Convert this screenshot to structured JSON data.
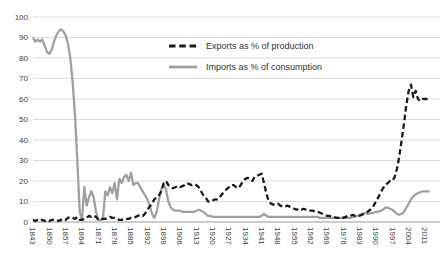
{
  "chart_data": {
    "type": "line",
    "title": "",
    "xlabel": "",
    "ylabel": "",
    "ylim": [
      0,
      100
    ],
    "y_ticks": [
      0,
      10,
      20,
      30,
      40,
      50,
      60,
      70,
      80,
      90,
      100
    ],
    "x_ticks": [
      1843,
      1850,
      1857,
      1864,
      1871,
      1878,
      1885,
      1892,
      1899,
      1906,
      1913,
      1920,
      1927,
      1934,
      1941,
      1948,
      1955,
      1962,
      1969,
      1976,
      1983,
      1990,
      1997,
      2004,
      2011
    ],
    "x_start": 1843,
    "x_end": 2013,
    "grid": "horizontal",
    "legend_position": "inside-top-center",
    "series": [
      {
        "name": "Exports as % of production",
        "style": "dashed",
        "color": "#1a1a1a",
        "values": [
          1,
          0.5,
          1,
          0.5,
          1,
          0.5,
          1,
          0.5,
          1,
          1,
          1,
          0.5,
          1,
          1.5,
          1,
          2,
          2.5,
          2,
          1.5,
          2.5,
          1,
          1,
          1.5,
          2,
          3,
          2.5,
          3,
          2.5,
          1,
          1,
          1.5,
          1.5,
          2,
          2.5,
          2,
          2,
          1.5,
          1,
          1,
          1.5,
          1.5,
          1.5,
          2,
          2,
          2.5,
          3,
          3.5,
          3,
          4,
          6,
          7.5,
          9,
          11,
          12,
          13,
          15,
          19,
          20,
          18,
          17,
          16.5,
          17,
          17.5,
          17,
          17.5,
          18,
          19,
          18.5,
          18,
          18.5,
          18,
          17,
          15,
          13,
          12,
          10,
          10,
          10.5,
          11,
          11,
          12,
          13.5,
          15,
          16,
          17,
          18,
          18,
          17,
          16.5,
          18,
          20,
          21,
          21.5,
          21,
          20,
          22,
          22.5,
          23,
          23.5,
          19,
          14,
          10,
          9,
          8.5,
          8.5,
          9,
          8,
          7.5,
          7.5,
          8,
          7.5,
          7,
          6.5,
          6,
          6.5,
          6,
          6.5,
          6,
          5.5,
          5.5,
          5.5,
          5,
          5,
          4.5,
          4,
          3.5,
          3,
          3,
          2.5,
          2.5,
          2,
          2,
          2.5,
          2,
          2.5,
          3,
          3,
          3.5,
          3,
          3,
          3,
          3.5,
          4,
          4.5,
          5.5,
          6.5,
          8,
          10,
          12,
          14.5,
          16.5,
          18,
          19,
          20,
          20,
          22,
          26,
          32,
          40,
          48,
          57,
          64,
          67,
          61,
          64,
          60,
          59,
          60,
          60,
          60,
          60
        ]
      },
      {
        "name": "Imports as % of consumption",
        "style": "solid",
        "color": "#a0a0a0",
        "values": [
          90,
          88,
          89,
          88,
          89,
          86,
          83,
          82,
          84,
          88,
          91,
          93,
          94,
          93,
          91,
          87,
          80,
          68,
          52,
          30,
          5,
          1,
          17,
          8,
          12,
          15,
          12,
          5,
          1,
          1,
          2,
          15,
          13,
          17,
          14,
          19,
          11,
          21,
          19,
          22,
          23,
          20,
          24,
          18,
          19,
          19,
          17,
          15,
          13,
          11,
          8,
          4,
          2,
          5,
          11,
          16,
          18,
          16,
          10,
          7,
          6,
          5.5,
          5.5,
          5.5,
          5,
          5,
          5,
          5,
          5,
          5,
          5.5,
          6,
          5.5,
          5,
          4,
          3,
          3,
          2.5,
          2.5,
          2.5,
          2.5,
          2.5,
          2.5,
          2.5,
          2.5,
          2.5,
          2.5,
          2.5,
          2.5,
          2.5,
          2.5,
          2.5,
          2.5,
          2.5,
          2.5,
          2.5,
          2.5,
          2.5,
          3,
          4,
          3,
          2.5,
          2.5,
          2.5,
          2.5,
          2.5,
          2.5,
          2.5,
          2.5,
          2.5,
          2.5,
          2.5,
          2.5,
          2.5,
          2.5,
          2.5,
          2.5,
          2.5,
          2.5,
          2.5,
          2.5,
          2.5,
          2.5,
          2,
          2,
          2,
          2,
          2,
          2,
          2,
          2,
          2,
          2,
          2,
          2,
          2,
          2,
          2.5,
          2.5,
          3,
          3.5,
          4,
          4.5,
          4,
          4,
          4.5,
          4.5,
          5,
          5,
          5.5,
          6,
          7,
          7,
          6.5,
          6,
          5,
          4,
          3.5,
          4,
          5,
          7,
          9,
          11,
          12.5,
          13.5,
          14,
          14.5,
          15,
          15,
          15,
          15
        ]
      }
    ]
  },
  "colors": {
    "background": "#ffffff",
    "gridline": "#dcdcdc",
    "axis_line": "#999999",
    "tick_text": "#404040",
    "legend_text": "#333333",
    "exports_line": "#1a1a1a",
    "imports_line": "#a0a0a0"
  }
}
